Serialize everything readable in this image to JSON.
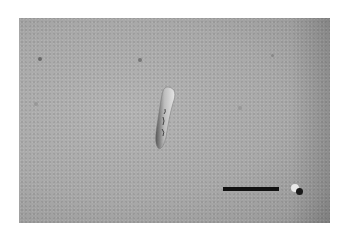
{
  "image": {
    "description": "DIC light micrograph of a single elongated, slightly curved cell on a grey background",
    "background_color": "#ababab",
    "frame": {
      "left": 19,
      "top": 18,
      "width": 311,
      "height": 205
    }
  },
  "cell": {
    "center_x": 166,
    "center_y": 119,
    "length": 64,
    "angle_deg": 25
  },
  "specks": [
    {
      "x": 40,
      "y": 59,
      "r": 2
    },
    {
      "x": 140,
      "y": 60,
      "r": 2
    },
    {
      "x": 36,
      "y": 104,
      "r": 2
    },
    {
      "x": 240,
      "y": 108,
      "r": 2
    },
    {
      "x": 273,
      "y": 55,
      "r": 1.5
    },
    {
      "x": 297,
      "y": 191,
      "r": 4
    }
  ],
  "scale_bar": {
    "x": 223,
    "y": 187,
    "width": 56,
    "height": 4,
    "color": "#111111",
    "label": ""
  }
}
